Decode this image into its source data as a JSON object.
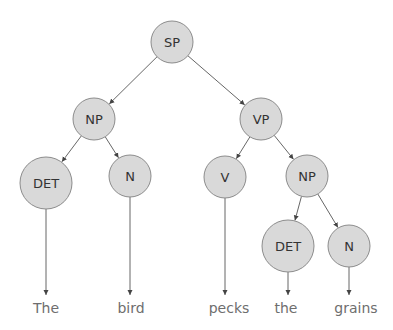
{
  "diagram": {
    "type": "parse-tree",
    "colors": {
      "node_fill": "#d9d9d9",
      "node_stroke": "#8c8c8c",
      "edge": "#555555",
      "word_text": "#6e6e6e",
      "node_text": "#333333"
    },
    "nodes": [
      {
        "id": "sp",
        "label": "SP",
        "cx": 172,
        "cy": 42,
        "r": 21
      },
      {
        "id": "np1",
        "label": "NP",
        "cx": 94,
        "cy": 119,
        "r": 21
      },
      {
        "id": "vp",
        "label": "VP",
        "cx": 261,
        "cy": 119,
        "r": 21
      },
      {
        "id": "det1",
        "label": "DET",
        "cx": 46,
        "cy": 183,
        "r": 26
      },
      {
        "id": "n1",
        "label": "N",
        "cx": 130,
        "cy": 176,
        "r": 21
      },
      {
        "id": "v",
        "label": "V",
        "cx": 225,
        "cy": 177,
        "r": 21
      },
      {
        "id": "np2",
        "label": "NP",
        "cx": 307,
        "cy": 176,
        "r": 21
      },
      {
        "id": "det2",
        "label": "DET",
        "cx": 288,
        "cy": 246,
        "r": 26
      },
      {
        "id": "n2",
        "label": "N",
        "cx": 349,
        "cy": 246,
        "r": 21
      }
    ],
    "edges": [
      {
        "from": "sp",
        "to": "np1"
      },
      {
        "from": "sp",
        "to": "vp"
      },
      {
        "from": "np1",
        "to": "det1"
      },
      {
        "from": "np1",
        "to": "n1"
      },
      {
        "from": "vp",
        "to": "v"
      },
      {
        "from": "vp",
        "to": "np2"
      },
      {
        "from": "np2",
        "to": "det2"
      },
      {
        "from": "np2",
        "to": "n2"
      }
    ],
    "words": [
      {
        "text": "The",
        "x": 46,
        "parent": "det1"
      },
      {
        "text": "bird",
        "x": 131,
        "parent": "n1"
      },
      {
        "text": "pecks",
        "x": 229,
        "parent": "v"
      },
      {
        "text": "the",
        "x": 286,
        "parent": "det2"
      },
      {
        "text": "grains",
        "x": 356,
        "parent": "n2"
      }
    ],
    "word_arrow_tip_y": 295,
    "word_baseline_y": 313
  }
}
